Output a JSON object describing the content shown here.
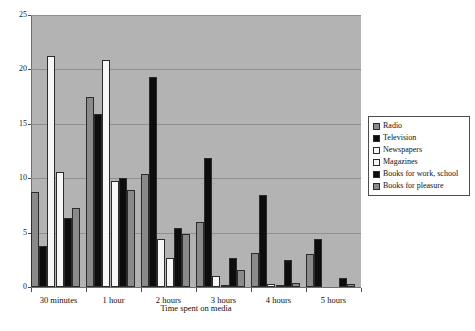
{
  "chart_data": {
    "type": "bar",
    "title": "",
    "xlabel": "Time spent on media",
    "ylabel": "",
    "ylim": [
      0,
      25
    ],
    "yticks": [
      0,
      5,
      10,
      15,
      20,
      25
    ],
    "grid": true,
    "legend_position": "right",
    "plot_background": "#b3b3b3",
    "categories": [
      "30 minutes",
      "1 hour",
      "2 hours",
      "3 hours",
      "4 hours",
      "5 hours"
    ],
    "series": [
      {
        "name": "Radio",
        "color": "#8a8a8a",
        "swatch": "gray",
        "values": [
          8.7,
          17.5,
          10.4,
          6.0,
          3.1,
          3.0
        ]
      },
      {
        "name": "Television",
        "color": "#0d0d0d",
        "swatch": "black",
        "values": [
          3.8,
          15.9,
          19.3,
          11.9,
          8.5,
          4.4
        ]
      },
      {
        "name": "Newspapers",
        "color": "#f7f7f7",
        "swatch": "white",
        "values": [
          21.2,
          20.9,
          4.4,
          1.0,
          0.3,
          0.0
        ]
      },
      {
        "name": "Magazines",
        "color": "#f7f7f7",
        "swatch": "white",
        "values": [
          10.6,
          9.7,
          2.7,
          0.2,
          0.1,
          0.0
        ]
      },
      {
        "name": "Books for work, school",
        "color": "#0d0d0d",
        "swatch": "black",
        "values": [
          6.3,
          10.0,
          5.4,
          2.7,
          2.5,
          0.8
        ]
      },
      {
        "name": "Books for pleasure",
        "color": "#8a8a8a",
        "swatch": "gray",
        "values": [
          7.3,
          8.9,
          4.9,
          1.6,
          0.4,
          0.3
        ]
      }
    ]
  }
}
